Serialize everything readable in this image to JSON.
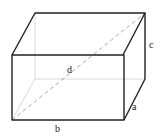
{
  "diagram": {
    "type": "rectangular-prism",
    "labels": {
      "a": "a",
      "b": "b",
      "c": "c",
      "d": "d"
    },
    "colors": {
      "visible_edge": "#222222",
      "hidden_edge": "#cccccc",
      "diagonal": "#aaaaaa"
    }
  }
}
